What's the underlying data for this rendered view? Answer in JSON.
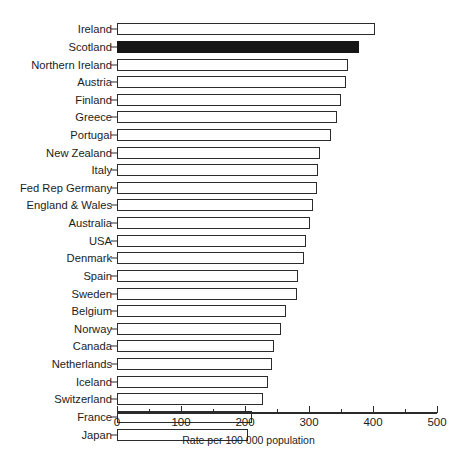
{
  "chart_data": {
    "type": "bar",
    "orientation": "horizontal",
    "title": "",
    "xlabel": "Rate per 100 000 population",
    "ylabel": "",
    "xlim": [
      0,
      500
    ],
    "xticks": [
      0,
      100,
      200,
      300,
      400,
      500
    ],
    "xtick_labels": [
      "0",
      "100",
      "200",
      "300",
      "400",
      "500"
    ],
    "minor_xticks": [
      50,
      150,
      250,
      350,
      450
    ],
    "grid": false,
    "legend": null,
    "highlight_category": "Scotland",
    "highlight_color": "#161616",
    "bar_color": "#ffffff",
    "bar_edge_color": "#2b2b2b",
    "categories": [
      "Ireland",
      "Scotland",
      "Northern Ireland",
      "Austria",
      "Finland",
      "Greece",
      "Portugal",
      "New Zealand",
      "Italy",
      "Fed Rep Germany",
      "England & Wales",
      "Australia",
      "USA",
      "Denmark",
      "Spain",
      "Sweden",
      "Belgium",
      "Norway",
      "Canada",
      "Netherlands",
      "Iceland",
      "Switzerland",
      "France",
      "Japan"
    ],
    "values": [
      403,
      378,
      361,
      358,
      350,
      344,
      334,
      317,
      314,
      312,
      306,
      302,
      295,
      292,
      283,
      281,
      264,
      256,
      245,
      242,
      236,
      228,
      211,
      205
    ]
  },
  "axis": {
    "x_title": "Rate per 100 000 population"
  },
  "top_artifact": {
    "text": ""
  }
}
